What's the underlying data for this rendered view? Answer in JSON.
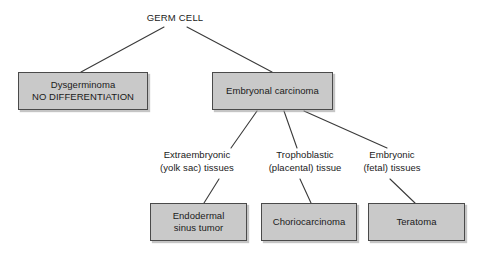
{
  "diagram": {
    "root": {
      "id": "germ-cell",
      "label": "GERM CELL"
    },
    "boxes": [
      {
        "id": "dysgerminoma",
        "line1": "Dysgerminoma",
        "line2": "NO DIFFERENTIATION"
      },
      {
        "id": "embryonal-carcinoma",
        "line1": "Embryonal carcinoma",
        "line2": ""
      },
      {
        "id": "endodermal-sinus-tumor",
        "line1": "Endodermal",
        "line2": "sinus tumor"
      },
      {
        "id": "choriocarcinoma",
        "line1": "Choriocarcinoma",
        "line2": ""
      },
      {
        "id": "teratoma",
        "line1": "Teratoma",
        "line2": ""
      }
    ],
    "mid_labels": [
      {
        "id": "extraembryonic",
        "line1": "Extraembryonic",
        "line2": "(yolk sac) tissues"
      },
      {
        "id": "trophoblastic",
        "line1": "Trophoblastic",
        "line2": "(placental) tissue"
      },
      {
        "id": "embryonic",
        "line1": "Embryonic",
        "line2": "(fetal) tissues"
      }
    ],
    "colors": {
      "box_fill": "#c9c9c9",
      "box_border": "#4a4a4a",
      "connector": "#3a3a3a",
      "text": "#1a1a1a",
      "background": "#ffffff"
    }
  }
}
